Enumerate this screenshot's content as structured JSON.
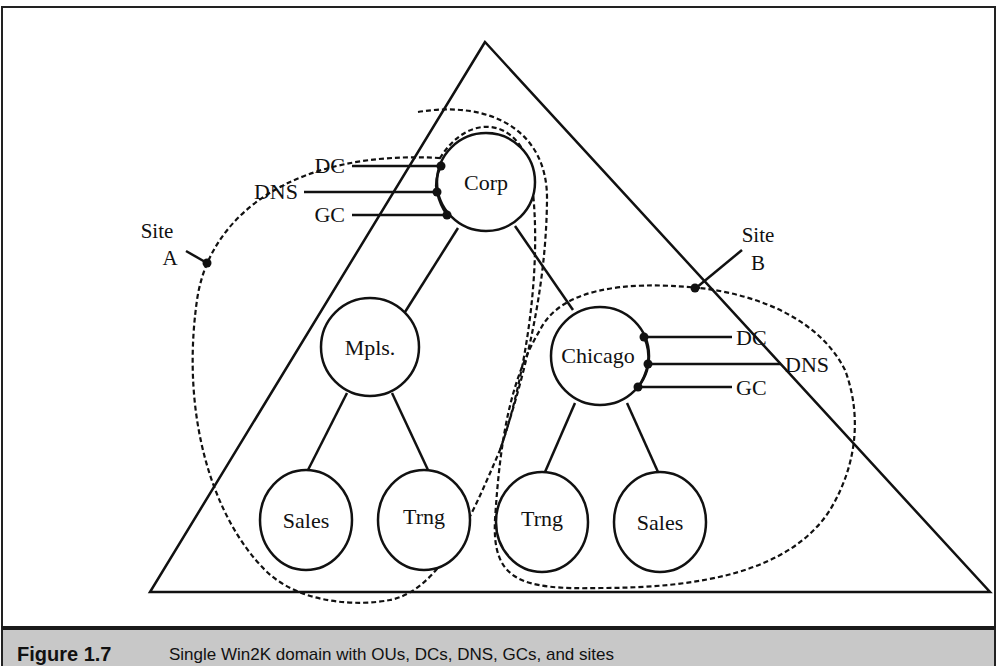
{
  "figure": {
    "number": "Figure 1.7",
    "caption": "Single Win2K domain with OUs, DCs, DNS, GCs, and sites"
  },
  "nodes": {
    "corp": "Corp",
    "mpls": "Mpls.",
    "chicago": "Chicago",
    "mpls_sales": "Sales",
    "mpls_trng": "Trng",
    "chicago_trng": "Trng",
    "chicago_sales": "Sales"
  },
  "services": {
    "corp": [
      "DC",
      "DNS",
      "GC"
    ],
    "chicago": [
      "DC",
      "DNS",
      "GC"
    ]
  },
  "sites": {
    "a": {
      "line1": "Site",
      "line2": "A"
    },
    "b": {
      "line1": "Site",
      "line2": "B"
    }
  },
  "colors": {
    "stroke": "#111111",
    "caption_bg": "#c8c8c8"
  }
}
